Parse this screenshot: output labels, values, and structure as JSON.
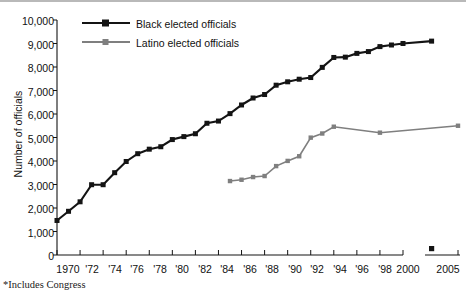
{
  "chart_data": {
    "type": "line",
    "title": "",
    "subtitle": "",
    "xlabel": "",
    "ylabel": "Number of officials",
    "xlim": [
      1970,
      2005
    ],
    "ylim": [
      0,
      10000
    ],
    "grid": false,
    "legend_position": "top-left",
    "y_ticks": [
      "0",
      "1,000",
      "2,000",
      "3,000",
      "4,000",
      "5,000",
      "6,000",
      "7,000",
      "8,000",
      "9,000",
      "10,000"
    ],
    "y_tick_values": [
      0,
      1000,
      2000,
      3000,
      4000,
      5000,
      6000,
      7000,
      8000,
      9000,
      10000
    ],
    "x_ticks": [
      "1970",
      "'72",
      "'74",
      "'76",
      "'78",
      "'80",
      "'82",
      "'84",
      "'86",
      "'88",
      "'90",
      "'92",
      "'94",
      "'96",
      "'98",
      "2000",
      "2005"
    ],
    "x_tick_values": [
      1970,
      1972,
      1974,
      1976,
      1978,
      1980,
      1982,
      1984,
      1986,
      1988,
      1990,
      1992,
      1994,
      1996,
      1998,
      2000,
      2005
    ],
    "axis_break_after": 2000,
    "series": [
      {
        "name": "Black elected officials",
        "color": "#141414",
        "marker": "square",
        "x": [
          1970,
          1971,
          1972,
          1973,
          1974,
          1975,
          1976,
          1977,
          1978,
          1979,
          1980,
          1981,
          1982,
          1983,
          1984,
          1985,
          1986,
          1987,
          1988,
          1989,
          1990,
          1991,
          1992,
          1993,
          1994,
          1995,
          1996,
          1997,
          1998,
          1999,
          2000,
          2001
        ],
        "values": [
          1469,
          1860,
          2264,
          2991,
          2991,
          3503,
          3979,
          4311,
          4503,
          4607,
          4912,
          5038,
          5160,
          5606,
          5700,
          6016,
          6384,
          6681,
          6829,
          7226,
          7370,
          7480,
          7552,
          7984,
          8406,
          8419,
          8579,
          8656,
          8868,
          8936,
          9001,
          9101
        ]
      },
      {
        "name": "Latino elected officials",
        "color": "#7f7f7f",
        "marker": "square",
        "x": [
          1985,
          1986,
          1987,
          1988,
          1989,
          1990,
          1991,
          1992,
          1993,
          1994,
          1998,
          2005
        ],
        "values": [
          3147,
          3202,
          3317,
          3360,
          3783,
          4004,
          4202,
          4994,
          5170,
          5459,
          5205,
          5500
        ]
      }
    ],
    "annotations": [
      {
        "name": "black-series-end-marker",
        "x": 2001,
        "y": 0,
        "note": "isolated black square marker near 2001 at baseline"
      }
    ]
  },
  "legend": {
    "items": [
      {
        "label": "Black elected officials",
        "color": "#141414"
      },
      {
        "label": "Latino elected officials",
        "color": "#7f7f7f"
      }
    ]
  },
  "axes": {
    "y_title": "Number of officials"
  },
  "footnote": "*Includes Congress"
}
